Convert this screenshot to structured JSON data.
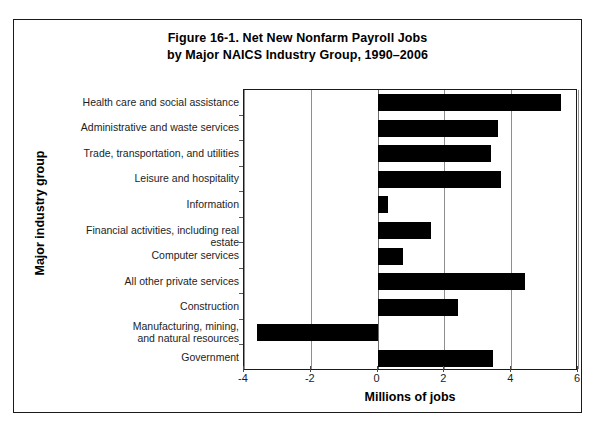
{
  "figure": {
    "title_line1": "Figure 16-1. Net New Nonfarm Payroll Jobs",
    "title_line2": "by Major NAICS Industry Group, 1990–2006"
  },
  "chart_data": {
    "type": "bar",
    "orientation": "horizontal",
    "title": "Figure 16-1. Net New Nonfarm Payroll Jobs by Major NAICS Industry Group, 1990–2006",
    "xlabel": "Millions of jobs",
    "ylabel": "Major industry group",
    "xlim": [
      -4,
      6
    ],
    "xticks": [
      -4,
      -2,
      0,
      2,
      4,
      6
    ],
    "xtick_labels": [
      "-4",
      "-2",
      "0",
      "2",
      "4",
      "6"
    ],
    "grid": "vertical",
    "legend": "none",
    "bar_color": "#000000",
    "categories": [
      "Health care and social assistance",
      "Administrative and waste services",
      "Trade, transportation, and utilities",
      "Leisure and hospitality",
      "Information",
      "Financial activities, including real estate",
      "Computer services",
      "All other private services",
      "Construction",
      "Manufacturing, mining,\nand natural resources",
      "Government"
    ],
    "values": [
      5.5,
      3.6,
      3.4,
      3.7,
      0.3,
      1.6,
      0.75,
      4.4,
      2.4,
      -3.6,
      3.45
    ]
  }
}
